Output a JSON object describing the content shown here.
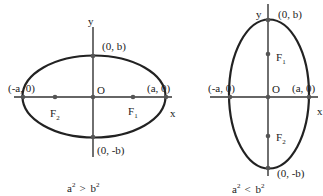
{
  "figures": [
    {
      "id": "horizontal-ellipse",
      "axis_labels": {
        "x": "x",
        "y": "y"
      },
      "origin_label": "O",
      "vertices": {
        "right": "(a, 0)",
        "left": "(-a, 0)",
        "top": "(0, b)",
        "bottom": "(0, -b)"
      },
      "foci": {
        "f1": "F",
        "f1_sub": "1",
        "f2": "F",
        "f2_sub": "2"
      },
      "caption": {
        "a": "a",
        "a_exp": "2",
        "rel": ">",
        "b": "b",
        "b_exp": "2"
      }
    },
    {
      "id": "vertical-ellipse",
      "axis_labels": {
        "x": "x",
        "y": "y"
      },
      "origin_label": "O",
      "vertices": {
        "right": "(a, 0)",
        "left": "(-a, 0)",
        "top": "(0, b)",
        "bottom": "(0, -b)"
      },
      "foci": {
        "f1": "F",
        "f1_sub": "1",
        "f2": "F",
        "f2_sub": "2"
      },
      "caption": {
        "a": "a",
        "a_exp": "2",
        "rel": "<",
        "b": "b",
        "b_exp": "2"
      }
    }
  ],
  "colors": {
    "stroke": "#222222",
    "point": "#555555",
    "background": "#ffffff"
  }
}
